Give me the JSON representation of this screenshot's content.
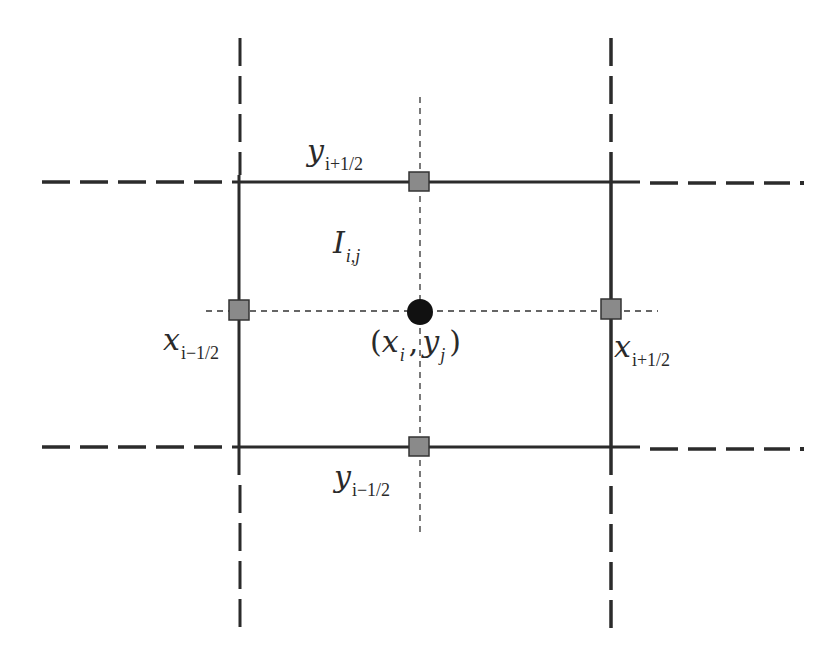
{
  "diagram": {
    "colors": {
      "background": "#ffffff",
      "line": "#2b2b2b",
      "face_marker_fill": "#8a8a8a",
      "face_marker_stroke": "#333333",
      "center_marker": "#111111"
    },
    "cell": {
      "label_main": "I",
      "label_sub": "i,j"
    },
    "center": {
      "open_paren": "(",
      "x_var": "x",
      "x_sub": "i",
      "separator": ",",
      "y_var": "y",
      "y_sub": "j",
      "close_paren": ")"
    },
    "faces": {
      "top": {
        "var": "y",
        "sub": "i+1/2"
      },
      "bottom": {
        "var": "y",
        "sub": "i−1/2"
      },
      "left": {
        "var": "x",
        "sub": "i−1/2"
      },
      "right": {
        "var": "x",
        "sub": "i+1/2"
      }
    },
    "geometry": {
      "left_x": 239,
      "right_x": 611,
      "top_y": 182,
      "bottom_y": 447,
      "center_x": 419,
      "center_y": 311
    }
  }
}
